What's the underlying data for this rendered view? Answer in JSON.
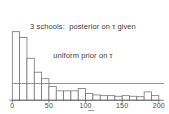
{
  "figure": {
    "title_line1": "3 schools:  posterior on τ given",
    "title_line2": "uniform prior on τ"
  },
  "chart_data": {
    "type": "bar",
    "subtype": "histogram",
    "title": "3 schools: posterior on τ given uniform prior on τ",
    "xlabel": "",
    "ylabel": "",
    "x_range": [
      0,
      200
    ],
    "bin_width": 10,
    "bin_edges": [
      0,
      10,
      20,
      30,
      40,
      50,
      60,
      70,
      80,
      90,
      100,
      110,
      120,
      130,
      140,
      150,
      160,
      170,
      180,
      190,
      200
    ],
    "rel_heights": [
      1.0,
      0.915,
      0.613,
      0.409,
      0.314,
      0.2,
      0.136,
      0.136,
      0.136,
      0.171,
      0.098,
      0.077,
      0.066,
      0.066,
      0.058,
      0.066,
      0.058,
      0.051,
      0.121,
      0.066
    ],
    "overlay_line": {
      "name": "uniform prior density",
      "rel_height": 0.244
    },
    "x_tick_values": [
      0,
      50,
      100,
      150,
      200
    ],
    "x_tick_labels": [
      "0",
      "50",
      "100",
      "150",
      "200"
    ],
    "y_axis_shown": false,
    "grid": false,
    "legend": "none",
    "bar_fill": "#ffffff",
    "line_color": "#6e6e6e",
    "axis_color": "#5a5a5a",
    "text_color": "#474747"
  }
}
